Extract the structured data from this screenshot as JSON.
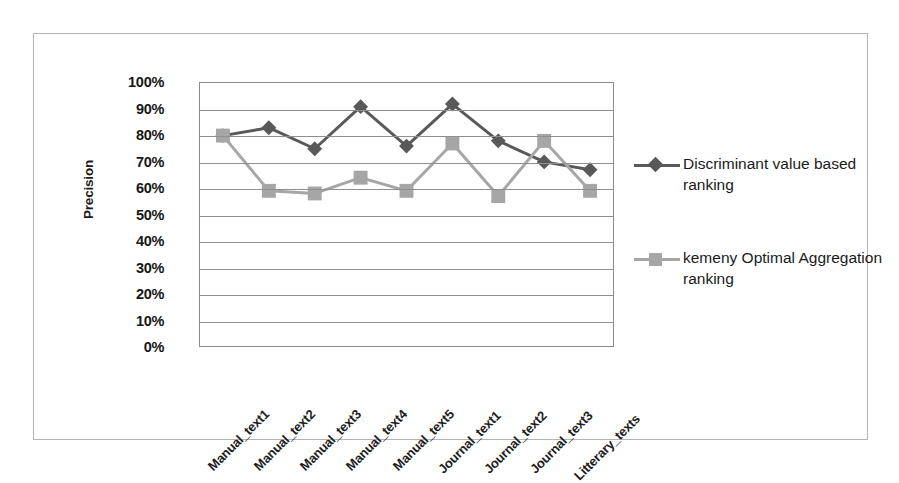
{
  "chart_data": {
    "type": "line",
    "title": "",
    "xlabel": "",
    "ylabel": "Precision",
    "ylim": [
      0,
      100
    ],
    "grid": true,
    "legend_position": "right",
    "categories": [
      "Manual_text1",
      "Manual_text2",
      "Manual_text3",
      "Manual_text4",
      "Manual_text5",
      "Journal_text1",
      "Journal_text2",
      "Journal_text3",
      "Litterary_texts"
    ],
    "ytick_labels": [
      "100%",
      "90%",
      "80%",
      "70%",
      "60%",
      "50%",
      "40%",
      "30%",
      "20%",
      "10%",
      "0%"
    ],
    "ytick_values": [
      100,
      90,
      80,
      70,
      60,
      50,
      40,
      30,
      20,
      10,
      0
    ],
    "series": [
      {
        "name": "Discriminant value based ranking",
        "marker": "diamond",
        "color": "#595959",
        "values": [
          80,
          83,
          75,
          91,
          76,
          92,
          78,
          70,
          67
        ]
      },
      {
        "name": "kemeny Optimal Aggregation ranking",
        "marker": "square",
        "color": "#a6a6a6",
        "values": [
          80,
          59,
          58,
          64,
          59,
          77,
          57,
          78,
          59
        ]
      }
    ]
  },
  "legend": {
    "entries": [
      {
        "label_line1": "Discriminant value",
        "label_line2": "based ranking"
      },
      {
        "label_line1": "kemeny Optimal",
        "label_line2": "Aggregation ranking"
      }
    ]
  },
  "colors": {
    "series_dark": "#595959",
    "series_light": "#a6a6a6",
    "gridline": "#8f8f8f",
    "plot_border": "#8a8a8a",
    "frame_border": "#b4b4b4",
    "text": "#1a1a1a"
  }
}
